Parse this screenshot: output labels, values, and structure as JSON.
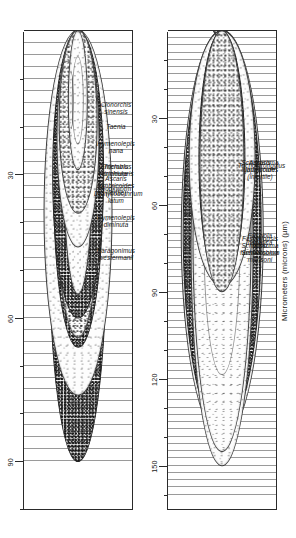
{
  "figure": {
    "axis_title": "Micrometers (microns) (µm)",
    "orientation": "rotated-90",
    "units": "µm"
  },
  "chart_data": {
    "type": "scatter",
    "title": "",
    "subtitle": "",
    "xlabel": "Micrometers (microns) (µm)",
    "ylabel": "",
    "grid": true,
    "legend_position": "none",
    "panels": [
      {
        "name": "upper-panel",
        "xlim": [
          0,
          100
        ],
        "ticks_major": [
          30,
          60,
          90
        ],
        "tick_labels": [
          "30",
          "60",
          "90"
        ],
        "tick_interval_minor": 10,
        "eggs": [
          {
            "label": "Paragonimus\nwestermanii",
            "length": 90,
            "width": 52,
            "shade": "dense",
            "operculum": true,
            "spine": false
          },
          {
            "label": "Hymenolepis\ndiminuta",
            "length": 76,
            "width": 62,
            "shade": "light",
            "operculum": false,
            "spine": false
          },
          {
            "label": "Diphyllobothrium\nlatum",
            "length": 66,
            "width": 44,
            "shade": "dense",
            "operculum": true,
            "spine": false
          },
          {
            "label": "Hookworm",
            "length": 64,
            "width": 40,
            "shade": "normal",
            "operculum": false,
            "spine": false
          },
          {
            "label": "Ascaris\nlumbricoides\n(fertile)",
            "length": 60,
            "width": 46,
            "shade": "dense",
            "operculum": false,
            "spine": false
          },
          {
            "label": "Trichuris\ntrichiura",
            "length": 55,
            "width": 26,
            "shade": "dense",
            "operculum": false,
            "spine": false
          },
          {
            "label": "Enterobius\nvermicularis",
            "length": 55,
            "width": 26,
            "shade": "light",
            "operculum": false,
            "spine": false
          },
          {
            "label": "Hymenolepis\nnana",
            "length": 45,
            "width": 38,
            "shade": "light",
            "operculum": false,
            "spine": false
          },
          {
            "label": "Taenia",
            "length": 38,
            "width": 34,
            "shade": "normal",
            "operculum": false,
            "spine": false
          },
          {
            "label": "Clonorchis\nsinensis",
            "length": 29,
            "width": 17,
            "shade": "light",
            "operculum": true,
            "spine": false
          }
        ]
      },
      {
        "name": "lower-panel",
        "xlim": [
          0,
          165
        ],
        "ticks_major": [
          30,
          60,
          90,
          120,
          150
        ],
        "tick_labels": [
          "30",
          "60",
          "90",
          "120",
          "150"
        ],
        "tick_interval_minor": 10,
        "eggs": [
          {
            "label": "Fasciolopsis\nbuski",
            "length": 140,
            "width": 82,
            "shade": "light",
            "operculum": true,
            "spine": false
          },
          {
            "label": "Fasciola\nhepatica",
            "length": 138,
            "width": 78,
            "shade": "dense",
            "operculum": true,
            "spine": false
          },
          {
            "label": "Schistosoma\nmansoni",
            "length": 150,
            "width": 62,
            "shade": "light",
            "operculum": false,
            "spine": true
          },
          {
            "label": "Schistosoma\nhaematobium",
            "length": 145,
            "width": 58,
            "shade": "light",
            "operculum": false,
            "spine": true
          },
          {
            "label": "Schistosoma\njaponicum",
            "length": 88,
            "width": 66,
            "shade": "light",
            "operculum": false,
            "spine": true
          },
          {
            "label": "Ascaris\nlumbricoides\n(infertile)",
            "length": 88,
            "width": 46,
            "shade": "dense",
            "operculum": false,
            "spine": false
          },
          {
            "label": "Trichostrongylus",
            "length": 90,
            "width": 44,
            "shade": "normal",
            "operculum": false,
            "spine": false
          }
        ]
      }
    ]
  }
}
